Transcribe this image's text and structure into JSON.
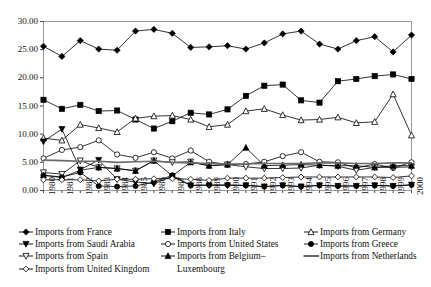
{
  "chart_data": {
    "type": "line",
    "title": "",
    "xlabel": "",
    "ylabel": "",
    "grid": false,
    "legend_position": "bottom",
    "x": [
      1980,
      1981,
      1982,
      1983,
      1984,
      1985,
      1986,
      1987,
      1988,
      1989,
      1990,
      1991,
      1992,
      1993,
      1994,
      1995,
      1996,
      1997,
      1998,
      1999,
      2000
    ],
    "xtick_labels": [
      "1980",
      "1981",
      "1982",
      "1983",
      "1984",
      "1985",
      "1986",
      "1987",
      "1988",
      "1989",
      "1990",
      "1991",
      "1992",
      "1993",
      "1994",
      "1995",
      "1996",
      "1997",
      "1998",
      "1999",
      "2000"
    ],
    "ytick_labels": [
      "0.00",
      "5.00",
      "10.00",
      "15.00",
      "20.00",
      "25.00",
      "30.00"
    ],
    "ytick_values": [
      0,
      5,
      10,
      15,
      20,
      25,
      30
    ],
    "ylim": [
      0,
      30
    ],
    "xlim": [
      1980,
      2000
    ],
    "series": [
      {
        "name": "Imports from France",
        "marker": "filled-diamond",
        "color": "#000000",
        "values": [
          25.6,
          23.8,
          26.6,
          25.1,
          24.9,
          28.3,
          28.6,
          27.9,
          25.4,
          25.5,
          25.7,
          25.1,
          26.2,
          27.8,
          28.3,
          26.0,
          25.1,
          26.6,
          27.3,
          24.6,
          27.6
        ]
      },
      {
        "name": "Imports from Italy",
        "marker": "filled-square",
        "color": "#000000",
        "values": [
          16.1,
          14.5,
          15.2,
          14.1,
          14.2,
          12.6,
          11.0,
          12.3,
          13.8,
          13.5,
          14.4,
          16.8,
          18.6,
          18.8,
          16.0,
          15.6,
          19.4,
          19.8,
          20.3,
          20.6,
          19.8
        ]
      },
      {
        "name": "Imports from Germany",
        "marker": "open-triangle-up",
        "color": "#000000",
        "values": [
          9.3,
          8.9,
          11.7,
          11.1,
          10.4,
          12.8,
          13.2,
          13.3,
          12.6,
          11.3,
          11.7,
          14.1,
          14.5,
          13.4,
          12.5,
          12.6,
          13.0,
          12.0,
          12.2,
          17.1,
          9.8
        ]
      },
      {
        "name": "Imports from Saudi Arabia",
        "marker": "filled-triangle-down",
        "color": "#000000",
        "values": [
          8.7,
          10.9,
          3.7,
          5.4,
          2.0,
          1.5,
          1.2,
          2.5,
          0.9,
          0.9,
          0.9,
          0.9,
          0.7,
          0.9,
          0.7,
          0.9,
          0.8,
          0.8,
          0.9,
          0.8,
          1.0
        ]
      },
      {
        "name": "Imports from United States",
        "marker": "open-circle",
        "color": "#000000",
        "values": [
          5.7,
          7.2,
          7.7,
          8.9,
          6.4,
          5.8,
          6.8,
          5.7,
          7.1,
          5.1,
          4.6,
          4.7,
          5.1,
          6.1,
          6.8,
          5.1,
          5.0,
          4.0,
          4.7,
          4.0,
          5.0
        ]
      },
      {
        "name": "Imports from Greece",
        "marker": "filled-circle",
        "color": "#000000",
        "values": [
          2.7,
          2.4,
          3.2,
          0.8,
          0.7,
          0.8,
          1.5,
          2.7,
          0.9,
          1.0,
          1.0,
          0.9,
          0.7,
          0.9,
          0.7,
          0.9,
          0.8,
          0.8,
          0.9,
          0.8,
          1.0
        ]
      },
      {
        "name": "Imports from Spain",
        "marker": "open-triangle-down",
        "color": "#000000",
        "values": [
          3.2,
          2.9,
          5.3,
          4.1,
          3.9,
          3.5,
          5.3,
          5.0,
          5.1,
          4.4,
          4.6,
          4.2,
          3.9,
          3.9,
          4.0,
          4.5,
          4.3,
          3.6,
          4.1,
          4.1,
          4.2
        ]
      },
      {
        "name": "Imports from Belgium–Luxembourg",
        "marker": "filled-triangle-up",
        "color": "#000000",
        "values": [
          2.7,
          2.3,
          3.6,
          4.1,
          3.9,
          3.5,
          5.3,
          2.6,
          5.0,
          4.4,
          4.6,
          7.6,
          4.4,
          4.5,
          4.6,
          4.5,
          4.4,
          4.4,
          4.1,
          4.4,
          4.4
        ]
      },
      {
        "name": "Imports from United Kingdom",
        "marker": "open-diamond",
        "color": "#000000",
        "values": [
          1.9,
          1.9,
          1.9,
          1.7,
          2.0,
          2.0,
          2.1,
          2.1,
          2.0,
          1.8,
          2.2,
          2.2,
          2.2,
          2.3,
          2.4,
          2.4,
          2.4,
          2.4,
          2.4,
          2.3,
          2.6
        ]
      },
      {
        "name": "Imports from Netherlands",
        "marker": "line-only",
        "color": "#6b6b6b",
        "values": [
          5.4,
          5.3,
          5.2,
          5.2,
          5.0,
          5.1,
          5.2,
          5.0,
          4.9,
          4.8,
          4.7,
          4.7,
          4.8,
          4.8,
          4.8,
          4.9,
          4.9,
          4.8,
          4.8,
          4.9,
          4.9
        ]
      }
    ]
  },
  "legend": {
    "columns": [
      {
        "entries": [
          {
            "label": "Imports from France",
            "marker": "filled-diamond"
          },
          {
            "label": "Imports from Saudi Arabia",
            "marker": "filled-triangle-down"
          },
          {
            "label": "Imports from Spain",
            "marker": "open-triangle-down"
          },
          {
            "label": "Imports from United Kingdom",
            "marker": "open-diamond"
          }
        ]
      },
      {
        "entries": [
          {
            "label": "Imports from Italy",
            "marker": "filled-square"
          },
          {
            "label": "Imports from United States",
            "marker": "open-circle"
          },
          {
            "label": "Imports from Belgium–",
            "marker": "filled-triangle-up"
          },
          {
            "label": "Luxembourg",
            "marker": "none"
          }
        ]
      },
      {
        "entries": [
          {
            "label": "Imports from Germany",
            "marker": "open-triangle-up"
          },
          {
            "label": "Imports from Greece",
            "marker": "filled-circle"
          },
          {
            "label": "Imports from Netherlands",
            "marker": "line-only"
          }
        ]
      }
    ]
  }
}
